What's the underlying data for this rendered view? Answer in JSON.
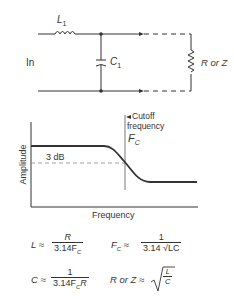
{
  "circuit": {
    "input_label": "In",
    "inductor_label": "L",
    "inductor_sub": "1",
    "capacitor_label": "C",
    "capacitor_sub": "1",
    "load_label": "R or Z"
  },
  "graph": {
    "y_axis_label": "Amplitude",
    "x_axis_label": "Frequency",
    "attenuation_label": "3 dB",
    "cutoff_label_line1": "Cutoff",
    "cutoff_label_line2": "frequency",
    "cutoff_symbol": "F",
    "cutoff_symbol_sub": "C"
  },
  "formulas": {
    "L": {
      "lhs": "L ≈",
      "num": "R",
      "den": "3.14F",
      "den_sub": "C"
    },
    "Fc": {
      "lhs": "F",
      "lhs_sub": "C",
      "approx": "≈",
      "num": "1",
      "den": "3.14 √LC"
    },
    "C": {
      "lhs": "C ≈",
      "num": "1",
      "den": "3.14F",
      "den_sub": "C",
      "den_tail": "R"
    },
    "RZ": {
      "lhs": "R or Z ≈",
      "radicand_num": "L",
      "radicand_den": "C"
    }
  },
  "colors": {
    "ink": "#333333",
    "dashed": "#888888",
    "background": "#ffffff"
  }
}
